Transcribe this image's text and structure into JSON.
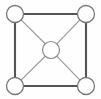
{
  "figure": {
    "width": 101,
    "height": 99,
    "background_color": "#fefefe"
  },
  "colors": {
    "square_edge": "#555555",
    "diagonal_edge": "#9a9a9a",
    "node_stroke": "#777777",
    "node_fill": "#ffffff",
    "center_node_stroke": "#8a8a8a"
  },
  "chart_data": {
    "type": "diagram",
    "layout": "node-link",
    "title": "",
    "nodes": [
      {
        "id": "top-left",
        "label": "",
        "cx": 15,
        "cy": 14,
        "r": 8.5,
        "role": "rim"
      },
      {
        "id": "top-right",
        "label": "",
        "cx": 86,
        "cy": 14,
        "r": 8.5,
        "role": "rim"
      },
      {
        "id": "bottom-left",
        "label": "",
        "cx": 15,
        "cy": 86,
        "r": 8.5,
        "role": "rim"
      },
      {
        "id": "bottom-right",
        "label": "",
        "cx": 86,
        "cy": 86,
        "r": 8.5,
        "role": "rim"
      },
      {
        "id": "center",
        "label": "",
        "cx": 51,
        "cy": 50,
        "r": 8.5,
        "role": "hub"
      }
    ],
    "edges": [
      {
        "source": "top-left",
        "target": "top-right",
        "style": "square",
        "x1": 23.5,
        "y1": 14,
        "x2": 77.5,
        "y2": 14
      },
      {
        "source": "top-right",
        "target": "bottom-right",
        "style": "square",
        "x1": 86,
        "y1": 22.5,
        "x2": 86,
        "y2": 77.5
      },
      {
        "source": "bottom-right",
        "target": "bottom-left",
        "style": "square",
        "x1": 77.5,
        "y1": 86,
        "x2": 23.5,
        "y2": 86
      },
      {
        "source": "bottom-left",
        "target": "top-left",
        "style": "square",
        "x1": 15,
        "y1": 77.5,
        "x2": 15,
        "y2": 22.5
      },
      {
        "source": "top-left",
        "target": "center",
        "style": "diagonal",
        "x1": 21.1,
        "y1": 19.9,
        "x2": 45.2,
        "y2": 43.8
      },
      {
        "source": "top-right",
        "target": "center",
        "style": "diagonal",
        "x1": 79.9,
        "y1": 19.9,
        "x2": 56.8,
        "y2": 43.8
      },
      {
        "source": "bottom-left",
        "target": "center",
        "style": "diagonal",
        "x1": 21.1,
        "y1": 80.1,
        "x2": 45.2,
        "y2": 56.2
      },
      {
        "source": "bottom-right",
        "target": "center",
        "style": "diagonal",
        "x1": 79.9,
        "y1": 80.1,
        "x2": 56.8,
        "y2": 56.2
      }
    ],
    "node_count": 5,
    "edge_count": 8
  }
}
